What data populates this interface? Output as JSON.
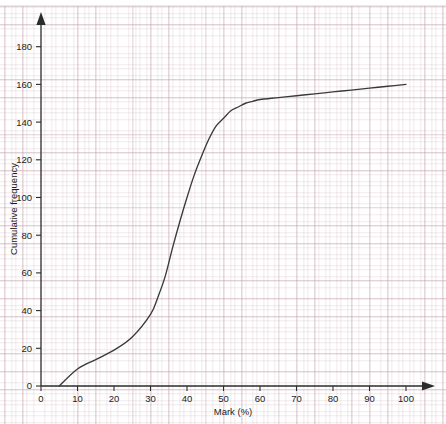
{
  "chart_data": {
    "type": "line",
    "title": "",
    "xlabel": "Mark (%)",
    "ylabel": "Cumulative frequency",
    "xlim": [
      0,
      100
    ],
    "ylim": [
      0,
      190
    ],
    "grid": true,
    "grid_style": "graph-paper",
    "legend": "none",
    "x_ticks": [
      0,
      10,
      20,
      30,
      40,
      50,
      60,
      70,
      80,
      90,
      100
    ],
    "x_tick_labels": [
      "0",
      "10",
      "20",
      "30",
      "40",
      "50",
      "60",
      "70",
      "80",
      "90",
      "100"
    ],
    "y_ticks": [
      0,
      20,
      40,
      60,
      80,
      100,
      120,
      140,
      160,
      180
    ],
    "y_tick_labels": [
      "0",
      "20",
      "40",
      "60",
      "80",
      "100",
      "120",
      "140",
      "160",
      "180"
    ],
    "series": [
      {
        "name": "Cumulative frequency",
        "color": "#3a3a3a",
        "x": [
          5,
          10,
          15,
          20,
          25,
          30,
          32,
          34,
          36,
          38,
          40,
          42,
          44,
          46,
          48,
          50,
          52,
          54,
          56,
          58,
          60,
          65,
          70,
          75,
          80,
          85,
          90,
          95,
          100
        ],
        "y": [
          0,
          9,
          14,
          19,
          26,
          38,
          47,
          58,
          73,
          87,
          100,
          112,
          122,
          131,
          138,
          142,
          146,
          148,
          150,
          151,
          152,
          153,
          154,
          155,
          156,
          157,
          158,
          159,
          160
        ]
      }
    ]
  },
  "axes": {
    "x_axis_label": "Mark (%)",
    "y_axis_label": "Cumulative frequency",
    "x_arrow": "right-arrow-icon",
    "y_arrow": "up-arrow-icon"
  },
  "style": {
    "curve_color": "#3a3a3a",
    "axis_color": "#2b2b2b",
    "grid_major_color": "#c4a0a8",
    "grid_minor_color": "#d0b6bc",
    "background_color": "#ffffff"
  }
}
